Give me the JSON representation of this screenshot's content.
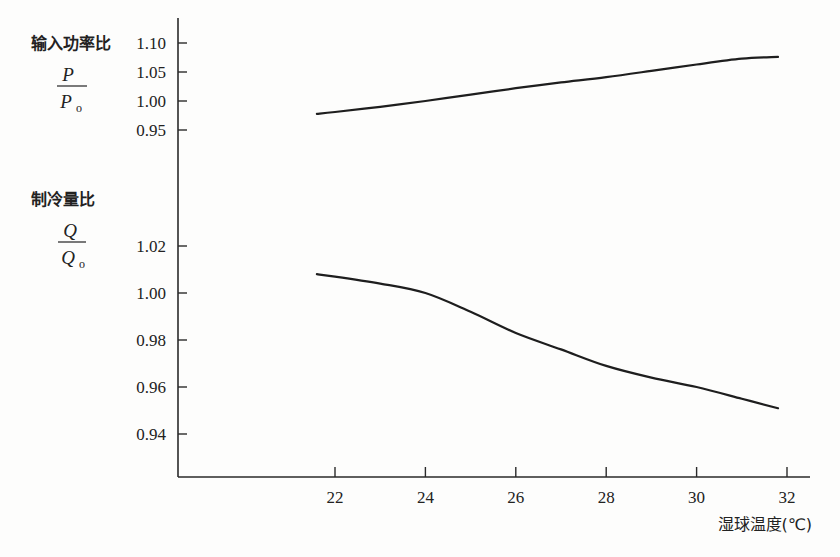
{
  "chart_data": [
    {
      "type": "line",
      "title": "",
      "ylabel": "输入功率比",
      "ylabel_fraction": {
        "numerator": "P",
        "denominator": "P",
        "denominator_sub": "o"
      },
      "xlabel": "湿球温度(℃)",
      "ylim": [
        0.93,
        1.12
      ],
      "yticks": [
        0.95,
        1.0,
        1.05,
        1.1
      ],
      "ytick_labels": [
        "0.95",
        "1.00",
        "1.05",
        "1.10"
      ],
      "x": [
        21.6,
        22,
        23,
        24,
        25,
        26,
        27,
        28,
        29,
        30,
        31,
        31.8
      ],
      "series": [
        {
          "name": "P/Po",
          "values": [
            0.978,
            0.981,
            0.99,
            1.0,
            1.011,
            1.022,
            1.032,
            1.041,
            1.052,
            1.063,
            1.073,
            1.076
          ]
        }
      ],
      "grid": false,
      "legend": "none"
    },
    {
      "type": "line",
      "title": "",
      "ylabel": "制冷量比",
      "ylabel_fraction": {
        "numerator": "Q",
        "denominator": "Q",
        "denominator_sub": "o"
      },
      "xlabel": "湿球温度(℃)",
      "xlim": [
        19.7,
        32.5
      ],
      "xticks": [
        22,
        24,
        26,
        28,
        30,
        32
      ],
      "xtick_labels": [
        "22",
        "24",
        "26",
        "28",
        "30",
        "32"
      ],
      "ylim": [
        0.93,
        1.03
      ],
      "yticks": [
        0.94,
        0.96,
        0.98,
        1.0,
        1.02
      ],
      "ytick_labels": [
        "0.94",
        "0.96",
        "0.98",
        "1.00",
        "1.02"
      ],
      "x": [
        21.6,
        22,
        23,
        24,
        25,
        26,
        27,
        28,
        29,
        30,
        31,
        31.8
      ],
      "series": [
        {
          "name": "Q/Qo",
          "values": [
            1.008,
            1.007,
            1.004,
            1.0,
            0.992,
            0.983,
            0.976,
            0.969,
            0.964,
            0.96,
            0.955,
            0.951
          ]
        }
      ],
      "grid": false,
      "legend": "none"
    }
  ],
  "labels": {
    "power_ratio": "输入功率比",
    "power_num": "P",
    "power_den": "P",
    "power_den_sub": "o",
    "cooling_ratio": "制冷量比",
    "cooling_num": "Q",
    "cooling_den": "Q",
    "cooling_den_sub": "o",
    "xlabel": "湿球温度(℃)"
  }
}
